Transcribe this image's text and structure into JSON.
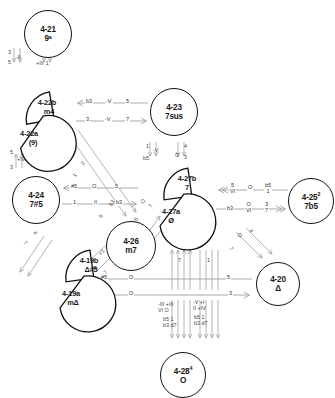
{
  "figure": {
    "type": "chord-relation-network",
    "title": "",
    "background": "#ffffff",
    "line_color": "#8a8a8a",
    "text_color": "#1a1a1a"
  },
  "nodes": [
    {
      "id": "4-21",
      "set": "4-21",
      "sup": "",
      "chord": "9ᵃ",
      "shape": "circle",
      "x": 24,
      "y": 10,
      "d": 46
    },
    {
      "id": "4-23",
      "set": "4-23",
      "sup": "",
      "chord": "7sus",
      "shape": "circle",
      "x": 150,
      "y": 88,
      "d": 46
    },
    {
      "id": "4-24",
      "set": "4-24",
      "sup": "",
      "chord": "7#5",
      "shape": "circle",
      "x": 12,
      "y": 176,
      "d": 46
    },
    {
      "id": "4-25",
      "set": "4-25",
      "sup": "2",
      "chord": "7b5",
      "shape": "circle",
      "x": 288,
      "y": 178,
      "d": 44
    },
    {
      "id": "4-26",
      "set": "4-26",
      "sup": "",
      "chord": "m7",
      "shape": "circle",
      "x": 106,
      "y": 221,
      "d": 48
    },
    {
      "id": "4-20",
      "set": "4-20",
      "sup": "",
      "chord": "Δ",
      "shape": "circle",
      "x": 256,
      "y": 262,
      "d": 42
    },
    {
      "id": "4-28",
      "set": "4-28",
      "sup": "4",
      "chord": "O",
      "shape": "circle",
      "x": 160,
      "y": 352,
      "d": 44
    }
  ],
  "half_nodes": [
    {
      "id": "4-22b",
      "set": "4-22b",
      "chord": "m4",
      "x": 18,
      "y": 88,
      "orient": "upper"
    },
    {
      "id": "4-22a",
      "set": "4-22a",
      "chord": "(9)",
      "x": 8,
      "y": 108,
      "orient": "lower"
    },
    {
      "id": "4-27b",
      "set": "4-27b",
      "chord": "7",
      "x": 158,
      "y": 166,
      "orient": "upper"
    },
    {
      "id": "4-27a",
      "set": "4-27a",
      "chord": "Ø",
      "x": 150,
      "y": 188,
      "orient": "lower"
    },
    {
      "id": "4-19b",
      "set": "4-19b",
      "chord": "Δ#5",
      "x": 62,
      "y": 250,
      "orient": "upper"
    },
    {
      "id": "4-19a",
      "set": "4-19a",
      "chord": "mΔ",
      "x": 52,
      "y": 272,
      "orient": "lower"
    }
  ],
  "arrow_groups": [
    {
      "id": "g-22-23",
      "rows": [
        {
          "dir": "left",
          "labels": [
            "b3",
            "-V",
            "5"
          ]
        },
        {
          "dir": "right",
          "labels": [
            "3",
            "-V",
            "7"
          ]
        }
      ]
    },
    {
      "id": "g-24-26",
      "rows": [
        {
          "dir": "left",
          "labels": [
            "#5",
            "O",
            "5"
          ]
        },
        {
          "dir": "right",
          "labels": [
            "1",
            "II",
            "b3"
          ]
        }
      ]
    },
    {
      "id": "g-27-25",
      "rows": [
        {
          "dir": "left",
          "double": true,
          "labels": [
            "5\nVI",
            "O",
            "b5\n1"
          ]
        },
        {
          "dir": "right",
          "double": true,
          "labels": [
            "b3",
            "O\nVI",
            "3\n7"
          ]
        }
      ]
    },
    {
      "id": "g-19-20",
      "rows": [
        {
          "dir": "left",
          "labels": [
            "#5",
            "O",
            "5"
          ]
        },
        {
          "dir": "right",
          "labels": [
            "b3",
            "O",
            "3"
          ]
        }
      ]
    }
  ],
  "annotations": [
    {
      "id": "a-21-left",
      "text": "3\n5",
      "sub": "-II"
    },
    {
      "id": "a-21-right",
      "text": "7",
      "sub": "+III  1"
    },
    {
      "id": "a-23-left",
      "text": "1\nb5",
      "sub": "-V"
    },
    {
      "id": "a-23-right",
      "text": "4\n3",
      "sub": "O"
    },
    {
      "id": "a-24-up-l",
      "text": "5\n3",
      "sub": "+IV"
    },
    {
      "id": "a-24-up-r",
      "text": "1\n3",
      "sub": "-V"
    },
    {
      "id": "a-bot-1",
      "text": "-III +III\nVI  O"
    },
    {
      "id": "a-bot-2",
      "text": "-V  +I\nII +IV"
    },
    {
      "id": "a-bot-3",
      "text": "b5  1\nb3  d7"
    },
    {
      "id": "a-bot-4",
      "text": "b5   1\nb3  d7"
    },
    {
      "id": "a-bot-v1",
      "text": "7"
    },
    {
      "id": "a-bot-v2",
      "text": "1"
    }
  ],
  "annotation_texts": {
    "t_3": "3",
    "t_5": "5",
    "t_7": "7",
    "t_1": "1",
    "t_4": "4",
    "t_b5": "b5",
    "t_b3": "b3",
    "t_d7": "d7",
    "t_hash5": "#5",
    "t_O": "O",
    "t_VI": "VI",
    "t_II": "II",
    "t_mII": "-II",
    "t_pIII": "+III",
    "t_mIII": "-III",
    "t_mV": "-V",
    "t_pIV": "+IV",
    "t_pI": "+I",
    "t_mIII_pIII": "-III +III",
    "t_VI_O": "VI  O",
    "t_mV_pI": "-V  +I",
    "t_II_pIV": "II +IV",
    "t_b5_1": "b5  1",
    "t_b3_d7": "b3  d7"
  },
  "diagonal_labels": [
    {
      "t": "5"
    },
    {
      "t": "3"
    },
    {
      "t": "2"
    },
    {
      "t": "1"
    },
    {
      "t": "b3"
    },
    {
      "t": "5"
    },
    {
      "t": "O"
    },
    {
      "t": "7"
    },
    {
      "t": "b5"
    },
    {
      "t": "1"
    },
    {
      "t": "-III"
    },
    {
      "t": "+1"
    },
    {
      "t": "O"
    },
    {
      "t": "7"
    },
    {
      "t": "4"
    },
    {
      "t": "7"
    },
    {
      "t": "O"
    },
    {
      "t": "4"
    },
    {
      "t": "7"
    }
  ]
}
